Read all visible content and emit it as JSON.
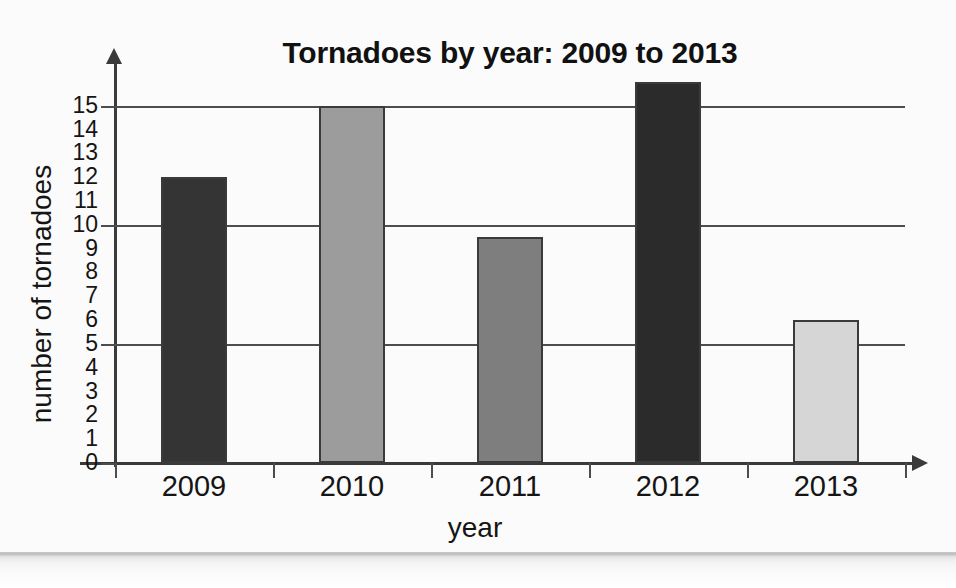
{
  "chart_data": {
    "type": "bar",
    "title": "Tornadoes by year: 2009 to 2013",
    "xlabel": "year",
    "ylabel": "number of tornadoes",
    "categories": [
      "2009",
      "2010",
      "2011",
      "2012",
      "2013"
    ],
    "values": [
      12,
      15,
      9.5,
      16,
      6
    ],
    "series": [
      {
        "name": "number of tornadoes",
        "values": [
          12,
          15,
          9.5,
          16,
          6
        ]
      }
    ],
    "bar_colors": [
      "#343434",
      "#9c9c9c",
      "#7e7e7e",
      "#2b2b2b",
      "#d6d6d6"
    ],
    "ylim": [
      0,
      16.5
    ],
    "y_tick_labels": [
      "15",
      "14",
      "13",
      "12",
      "11",
      "10",
      "9",
      "8",
      "7",
      "6",
      "5",
      "4",
      "3",
      "2",
      "1",
      "0"
    ],
    "y_tick_values": [
      15,
      14,
      13,
      12,
      11,
      10,
      9,
      8,
      7,
      6,
      5,
      4,
      3,
      2,
      1,
      0
    ],
    "gridline_values": [
      15,
      10,
      5,
      0
    ],
    "grid": true,
    "legend": "none",
    "axis_color": "#3a3a3a",
    "text_color": "#151515",
    "background_color": "#fbfbfb"
  },
  "chart": {
    "title": "Tornadoes by year: 2009 to 2013",
    "x_axis_title": "year",
    "y_axis_title": "number of tornadoes",
    "y_ticks": [
      {
        "label": "15",
        "value": 15
      },
      {
        "label": "14",
        "value": 14
      },
      {
        "label": "13",
        "value": 13
      },
      {
        "label": "12",
        "value": 12
      },
      {
        "label": "11",
        "value": 11
      },
      {
        "label": "10",
        "value": 10
      },
      {
        "label": "9",
        "value": 9
      },
      {
        "label": "8",
        "value": 8
      },
      {
        "label": "7",
        "value": 7
      },
      {
        "label": "6",
        "value": 6
      },
      {
        "label": "5",
        "value": 5
      },
      {
        "label": "4",
        "value": 4
      },
      {
        "label": "3",
        "value": 3
      },
      {
        "label": "2",
        "value": 2
      },
      {
        "label": "1",
        "value": 1
      },
      {
        "label": "0",
        "value": 0
      }
    ],
    "bars": [
      {
        "label": "2009",
        "value": 12,
        "color": "#343434"
      },
      {
        "label": "2010",
        "value": 15,
        "color": "#9c9c9c"
      },
      {
        "label": "2011",
        "value": 9.5,
        "color": "#7e7e7e"
      },
      {
        "label": "2012",
        "value": 16,
        "color": "#2b2b2b"
      },
      {
        "label": "2013",
        "value": 6,
        "color": "#d6d6d6"
      }
    ]
  }
}
